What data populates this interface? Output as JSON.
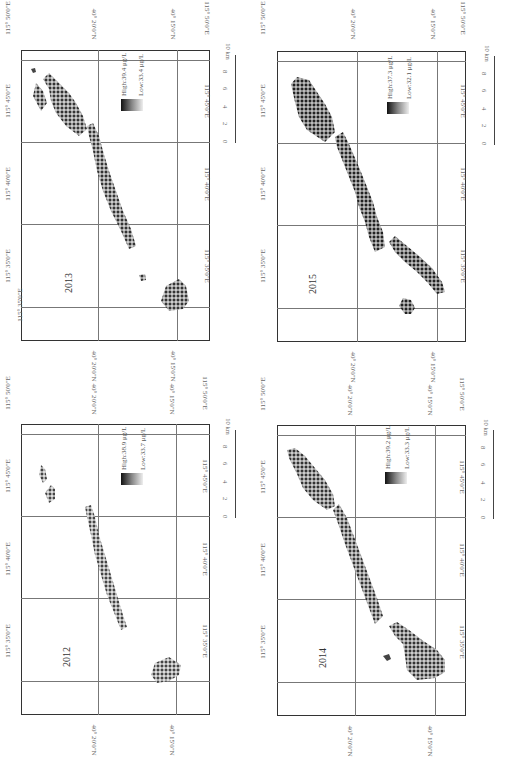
{
  "figure": {
    "type": "multi-panel map (rotated 90°)",
    "colormap": {
      "high_color": "#111111",
      "low_color": "#eeeeee"
    },
    "scale_bar": {
      "ticks": [
        "0",
        "2",
        "4",
        "6",
        "8",
        "10 km"
      ]
    },
    "panels": [
      {
        "year": "2013",
        "legend_high": "High:39.4 μg/L",
        "legend_low": "Low:33.4 μg/L",
        "lon_labels": [
          "115° 35'0\"E",
          "115° 40'0\"E",
          "115° 45'0\"E",
          "115° 50'0\"E"
        ],
        "lat_labels": [
          "40° 20'0\"N",
          "40° 15'0\"N"
        ]
      },
      {
        "year": "2015",
        "legend_high": "High:37.3 μg/L",
        "legend_low": "Low:32.1 μg/L",
        "lon_labels": [
          "115° 35'0\"E",
          "115° 40'0\"E",
          "115° 45'0\"E",
          "115° 50'0\"E"
        ],
        "lat_labels": [
          "40° 20'0\"N",
          "40° 15'0\"N"
        ]
      },
      {
        "year": "2012",
        "legend_high": "High:38.9 μg/L",
        "legend_low": "Low:33.7 μg/L",
        "lon_labels": [
          "115° 35'0\"E",
          "115° 40'0\"E",
          "115° 45'0\"E",
          "115° 50'0\"E"
        ],
        "lat_labels": [
          "40° 20'0\"N",
          "40° 15'0\"N"
        ]
      },
      {
        "year": "2014",
        "legend_high": "High:39.2 μg/L",
        "legend_low": "Low:33.3 μg/L",
        "lon_labels": [
          "115° 35'0\"E",
          "115° 40'0\"E",
          "115° 45'0\"E",
          "115° 50'0\"E"
        ],
        "lat_labels": [
          "40° 20'0\"N",
          "40° 15'0\"N"
        ]
      }
    ]
  }
}
